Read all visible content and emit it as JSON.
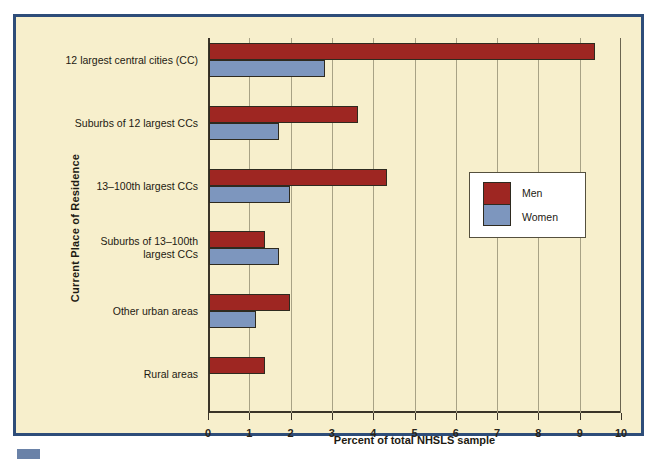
{
  "colors": {
    "men": "#9e2622",
    "women": "#7d96be",
    "background": "#f7efcc",
    "frame": "#2e4d79",
    "gridline": "#a8a285",
    "axis": "#3a3428"
  },
  "legend": {
    "entries": [
      {
        "label": "Men",
        "color": "#9e2622"
      },
      {
        "label": "Women",
        "color": "#7d96be"
      }
    ]
  },
  "axes": {
    "ylabel": "Current Place of Residence",
    "xlabel": "Percent of total NHSLS sample",
    "xticks": [
      "0",
      "1",
      "2",
      "3",
      "4",
      "5",
      "6",
      "7",
      "8",
      "9",
      "10"
    ]
  },
  "chart_data": {
    "type": "bar",
    "orientation": "horizontal",
    "title": "",
    "xlabel": "Percent of total NHSLS sample",
    "ylabel": "Current Place of Residence",
    "xlim": [
      0,
      10
    ],
    "xticks": [
      0,
      1,
      2,
      3,
      4,
      5,
      6,
      7,
      8,
      9,
      10
    ],
    "grid": "vertical",
    "legend_position": "right-middle",
    "categories": [
      "12 largest central cities (CC)",
      "Suburbs of 12 largest CCs",
      "13–100th largest CCs",
      "Suburbs of 13–100th\nlargest CCs",
      "Other urban areas",
      "Rural areas"
    ],
    "series": [
      {
        "name": "Men",
        "color": "#9e2622",
        "values": [
          9.35,
          3.6,
          4.3,
          1.35,
          1.95,
          1.35
        ]
      },
      {
        "name": "Women",
        "color": "#7d96be",
        "values": [
          2.8,
          1.7,
          1.95,
          1.7,
          1.15,
          null
        ]
      }
    ]
  }
}
